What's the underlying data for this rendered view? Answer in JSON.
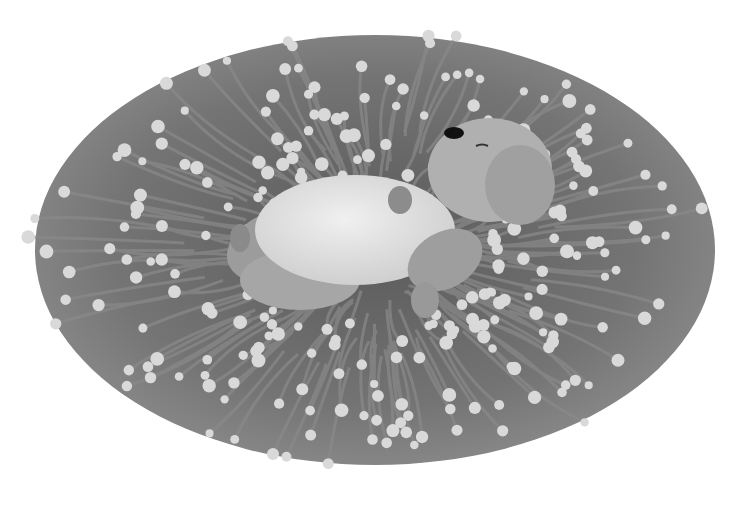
{
  "image": {
    "description": "Grayscale illustration of a furry animal lying on its back, eyes closed, resting on a large oval mat of radiating tentacles tipped with pale round knobs (sea-anemone-like).",
    "colors": {
      "background": "#ffffff",
      "tentacle_base": "#6e6e6e",
      "tentacle_dark": "#4a4a4a",
      "knob": "#d6d6d6",
      "animal_fur": "#a8a8a8",
      "belly": "#e4e4e4",
      "nose": "#111111"
    }
  }
}
